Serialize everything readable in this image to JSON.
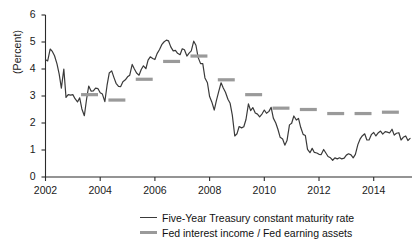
{
  "chart_data": {
    "type": "line",
    "title": "",
    "xlabel": "",
    "ylabel": "(Percent)",
    "xlim": [
      2002.0,
      2015.4
    ],
    "ylim": [
      0,
      6
    ],
    "yticks": [
      0,
      1,
      2,
      3,
      4,
      5,
      6
    ],
    "xticks": [
      2002,
      2004,
      2006,
      2008,
      2010,
      2012,
      2014
    ],
    "xtick_labels": [
      "2002",
      "2004",
      "2006",
      "2008",
      "2010",
      "2012",
      "2014"
    ],
    "ytick_labels": [
      "0",
      "1",
      "2",
      "3",
      "4",
      "5",
      "6"
    ],
    "grid": false,
    "legend_position": "bottom",
    "series": [
      {
        "name": "Five-Year Treasury constant maturity rate",
        "type": "line",
        "color": "#3a3a3a",
        "x": [
          2002.0,
          2002.08,
          2002.17,
          2002.25,
          2002.33,
          2002.42,
          2002.5,
          2002.58,
          2002.67,
          2002.75,
          2002.83,
          2002.92,
          2003.0,
          2003.08,
          2003.17,
          2003.25,
          2003.33,
          2003.42,
          2003.5,
          2003.58,
          2003.67,
          2003.75,
          2003.83,
          2003.92,
          2004.0,
          2004.08,
          2004.17,
          2004.25,
          2004.33,
          2004.42,
          2004.5,
          2004.58,
          2004.67,
          2004.75,
          2004.83,
          2004.92,
          2005.0,
          2005.08,
          2005.17,
          2005.25,
          2005.33,
          2005.42,
          2005.5,
          2005.58,
          2005.67,
          2005.75,
          2005.83,
          2005.92,
          2006.0,
          2006.08,
          2006.17,
          2006.25,
          2006.33,
          2006.42,
          2006.5,
          2006.58,
          2006.67,
          2006.75,
          2006.83,
          2006.92,
          2007.0,
          2007.08,
          2007.17,
          2007.25,
          2007.33,
          2007.42,
          2007.5,
          2007.58,
          2007.67,
          2007.75,
          2007.83,
          2007.92,
          2008.0,
          2008.08,
          2008.17,
          2008.25,
          2008.33,
          2008.42,
          2008.5,
          2008.58,
          2008.67,
          2008.75,
          2008.83,
          2008.92,
          2009.0,
          2009.08,
          2009.17,
          2009.25,
          2009.33,
          2009.42,
          2009.5,
          2009.58,
          2009.67,
          2009.75,
          2009.83,
          2009.92,
          2010.0,
          2010.08,
          2010.17,
          2010.25,
          2010.33,
          2010.42,
          2010.5,
          2010.58,
          2010.67,
          2010.75,
          2010.83,
          2010.92,
          2011.0,
          2011.08,
          2011.17,
          2011.25,
          2011.33,
          2011.42,
          2011.5,
          2011.58,
          2011.67,
          2011.75,
          2011.83,
          2011.92,
          2012.0,
          2012.08,
          2012.17,
          2012.25,
          2012.33,
          2012.42,
          2012.5,
          2012.58,
          2012.67,
          2012.75,
          2012.83,
          2012.92,
          2013.0,
          2013.08,
          2013.17,
          2013.25,
          2013.33,
          2013.42,
          2013.5,
          2013.58,
          2013.67,
          2013.75,
          2013.83,
          2013.92,
          2014.0,
          2014.08,
          2014.17,
          2014.25,
          2014.33,
          2014.42,
          2014.5,
          2014.58,
          2014.67,
          2014.75,
          2014.83,
          2014.92,
          2015.0,
          2015.08,
          2015.17,
          2015.25,
          2015.33
        ],
        "values": [
          4.34,
          4.3,
          4.74,
          4.65,
          4.49,
          4.19,
          3.81,
          3.29,
          3.999,
          2.95,
          3.05,
          3.03,
          3.05,
          2.9,
          2.78,
          2.93,
          2.52,
          2.27,
          2.87,
          3.37,
          3.18,
          3.19,
          3.29,
          3.27,
          3.12,
          3.07,
          2.79,
          3.39,
          3.85,
          3.93,
          3.69,
          3.47,
          3.36,
          3.35,
          3.53,
          3.6,
          3.71,
          3.77,
          4.17,
          4.0,
          3.85,
          3.77,
          3.98,
          4.12,
          4.01,
          4.33,
          4.45,
          4.39,
          4.35,
          4.57,
          4.72,
          4.9,
          5.0,
          5.07,
          5.04,
          4.82,
          4.67,
          4.69,
          4.58,
          4.53,
          4.75,
          4.71,
          4.48,
          4.59,
          4.67,
          5.03,
          4.88,
          4.43,
          4.2,
          4.2,
          3.67,
          3.49,
          2.98,
          2.78,
          2.48,
          2.84,
          3.15,
          3.49,
          3.3,
          3.14,
          2.88,
          2.73,
          2.29,
          1.52,
          1.6,
          1.87,
          1.82,
          1.86,
          2.13,
          2.71,
          2.46,
          2.57,
          2.37,
          2.33,
          2.23,
          2.34,
          2.48,
          2.36,
          2.43,
          2.58,
          2.18,
          2.0,
          1.76,
          1.47,
          1.41,
          1.18,
          1.35,
          1.93,
          1.99,
          2.26,
          2.11,
          2.17,
          1.84,
          1.58,
          1.54,
          1.02,
          0.9,
          1.06,
          0.91,
          0.89,
          0.84,
          0.83,
          1.02,
          0.89,
          0.76,
          0.71,
          0.62,
          0.71,
          0.67,
          0.71,
          0.67,
          0.7,
          0.81,
          0.86,
          0.82,
          0.71,
          0.84,
          1.2,
          1.4,
          1.52,
          1.6,
          1.37,
          1.37,
          1.58,
          1.65,
          1.52,
          1.64,
          1.7,
          1.59,
          1.68,
          1.66,
          1.63,
          1.77,
          1.55,
          1.62,
          1.64,
          1.37,
          1.47,
          1.52,
          1.35,
          1.43
        ]
      },
      {
        "name": "Fed interest income / Fed earning assets",
        "type": "annual-step-marks",
        "color": "#9a9a9a",
        "years": [
          2003,
          2004,
          2005,
          2006,
          2007,
          2008,
          2009,
          2010,
          2011,
          2012,
          2013,
          2014
        ],
        "values": [
          3.05,
          2.85,
          3.62,
          4.28,
          4.48,
          3.6,
          3.05,
          2.55,
          2.5,
          2.35,
          2.35,
          2.4
        ]
      }
    ]
  },
  "legend": {
    "entries": [
      {
        "label": "Five-Year Treasury constant maturity rate",
        "style": "line-dark"
      },
      {
        "label": "Fed interest income / Fed earning assets",
        "style": "line-gray"
      }
    ]
  },
  "axis": {
    "y_axis_title": "(Percent)"
  }
}
